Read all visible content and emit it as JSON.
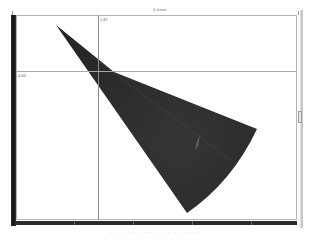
{
  "viewer": {
    "scale_label_top": "0.0mm",
    "crosshair": {
      "x_label": "1.87",
      "y_label": "0.00",
      "x_px": 98,
      "y_px": 71
    },
    "right_bar_label": "depth",
    "caption": ". . . . . . . .   . . .   . . .   ...",
    "colors": {
      "background": "#ffffff",
      "scan_fill": "#2e2e2e",
      "ruler": "#1a1a1a",
      "frame_border": "#b4b4b4",
      "crosshair": "#8a8a8a"
    },
    "scan_sector": {
      "apex": [
        56,
        25
      ],
      "notch": [
        114,
        72
      ],
      "right_corner": [
        257,
        129
      ],
      "bottom_tip": [
        187,
        213
      ]
    }
  }
}
